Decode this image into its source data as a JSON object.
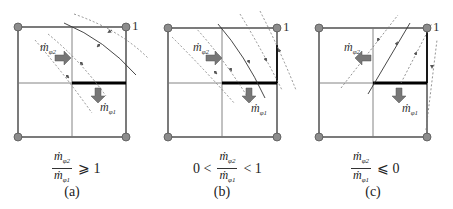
{
  "figure": {
    "colors": {
      "grid_line": "#555555",
      "thick_face": "#000000",
      "node_fill": "#8c8c8c",
      "arrow_fill": "#707070",
      "streamline": "#666666"
    },
    "panels": [
      {
        "id": "a",
        "label": "(a)",
        "node_label": "1",
        "flow_labels": {
          "mphi2": "ṁ",
          "mphi2_sub": "φ2",
          "mphi1": "ṁ",
          "mphi1_sub": "φ1"
        },
        "condition": {
          "prefix": "",
          "numerator": "ṁ",
          "numerator_sub": "φ2",
          "denominator": "ṁ",
          "denominator_sub": "φ1",
          "relation": "⩾ 1"
        },
        "mphi2_direction": "right"
      },
      {
        "id": "b",
        "label": "(b)",
        "node_label": "1",
        "flow_labels": {
          "mphi2": "ṁ",
          "mphi2_sub": "φ2",
          "mphi1": "ṁ",
          "mphi1_sub": "φ1"
        },
        "condition": {
          "prefix": "0 <",
          "numerator": "ṁ",
          "numerator_sub": "φ2",
          "denominator": "ṁ",
          "denominator_sub": "φ1",
          "relation": "< 1"
        },
        "mphi2_direction": "right"
      },
      {
        "id": "c",
        "label": "(c)",
        "node_label": "1",
        "flow_labels": {
          "mphi2": "ṁ",
          "mphi2_sub": "φ2",
          "mphi1": "ṁ",
          "mphi1_sub": "φ1"
        },
        "condition": {
          "prefix": "",
          "numerator": "ṁ",
          "numerator_sub": "φ2",
          "denominator": "ṁ",
          "denominator_sub": "φ1",
          "relation": "⩽ 0"
        },
        "mphi2_direction": "left"
      }
    ]
  }
}
